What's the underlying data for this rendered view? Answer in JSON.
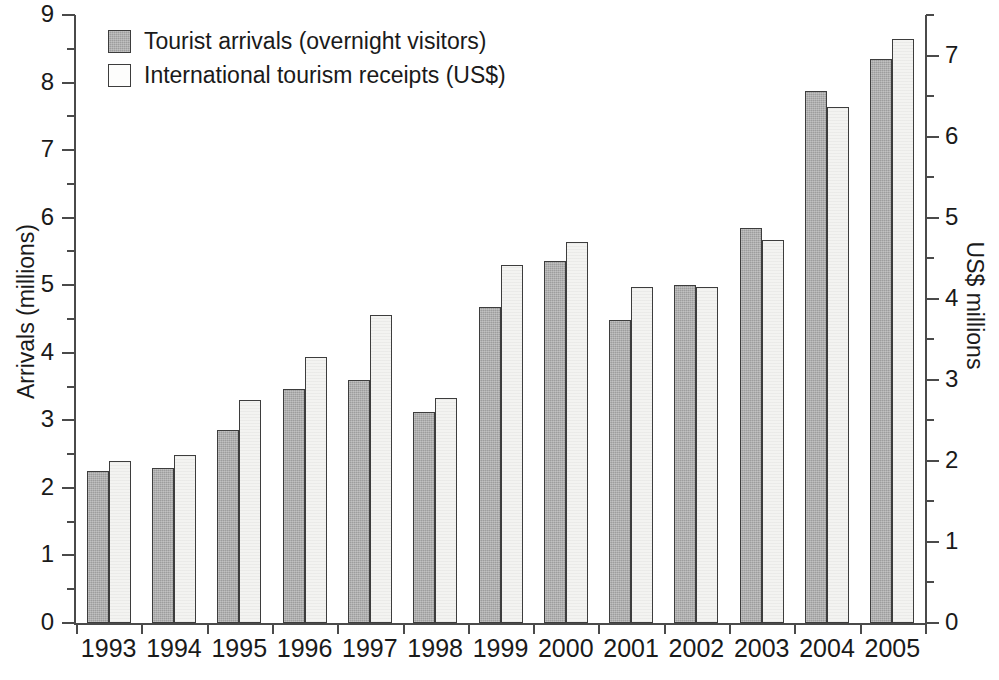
{
  "chart_data": {
    "type": "bar",
    "title": "",
    "subtitle": "",
    "xlabel": "",
    "ylabel": "Arrivals (millions)",
    "y2label": "US$ millions",
    "grid": false,
    "legend_position": "top-left",
    "ylim": [
      0,
      9
    ],
    "y2lim": [
      0,
      7.5
    ],
    "yticks": [
      0,
      1,
      2,
      3,
      4,
      5,
      6,
      7,
      8,
      9
    ],
    "yticklabels": [
      "0",
      "1",
      "2",
      "3",
      "4",
      "5",
      "6",
      "7",
      "8",
      "9"
    ],
    "y_minor_ticks": [
      0.5,
      1.5,
      2.5,
      3.5,
      4.5,
      5.5,
      6.5,
      7.5,
      8.5
    ],
    "y2ticks": [
      0,
      1,
      2,
      3,
      4,
      5,
      6,
      7
    ],
    "y2ticklabels": [
      "0",
      "1",
      "2",
      "3",
      "4",
      "5",
      "6",
      "7"
    ],
    "y2_minor_ticks": [
      0.5,
      1.5,
      2.5,
      3.5,
      4.5,
      5.5,
      6.5,
      7.5
    ],
    "categories": [
      "1993",
      "1994",
      "1995",
      "1996",
      "1997",
      "1998",
      "1999",
      "2000",
      "2001",
      "2002",
      "2003",
      "2004",
      "2005"
    ],
    "series": [
      {
        "name": "Tourist arrivals (overnight visitors)",
        "axis": "left",
        "units": "millions",
        "color": "#9d9d9d",
        "values": [
          2.25,
          2.3,
          2.85,
          3.47,
          3.6,
          3.12,
          4.68,
          5.36,
          4.48,
          5.0,
          5.85,
          7.88,
          8.35
        ]
      },
      {
        "name": "International tourism receipts (US$)",
        "axis": "right",
        "units": "US$ millions",
        "color": "#f3f3f1",
        "values": [
          2.0,
          2.07,
          2.75,
          3.28,
          3.8,
          2.77,
          4.42,
          4.7,
          4.15,
          4.15,
          4.72,
          6.37,
          7.2
        ]
      }
    ]
  },
  "legend": {
    "items": [
      {
        "label": "Tourist arrivals (overnight visitors)",
        "swatch": "dark"
      },
      {
        "label": "International tourism receipts (US$)",
        "swatch": "light"
      }
    ]
  }
}
